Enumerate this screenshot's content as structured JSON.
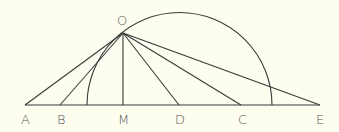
{
  "diagram": {
    "type": "geometry",
    "labels": {
      "O": "O",
      "A": "A",
      "B": "B",
      "M": "M",
      "D": "D",
      "C": "C",
      "E": "E"
    },
    "colors": {
      "background": "#fdfdf0",
      "stroke": "#3a3a3a",
      "text": "#555555"
    }
  }
}
